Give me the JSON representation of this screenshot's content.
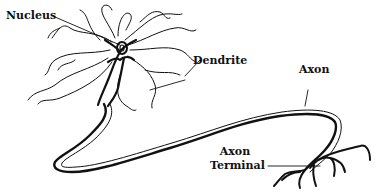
{
  "diagram": {
    "labels": {
      "nucleus": "Nucleus",
      "dendrite": "Dendrite",
      "axon": "Axon",
      "axon_terminal_line1": "Axon",
      "axon_terminal_line2": "Terminal"
    },
    "colors": {
      "stroke": "#111111",
      "background": "#ffffff"
    }
  }
}
